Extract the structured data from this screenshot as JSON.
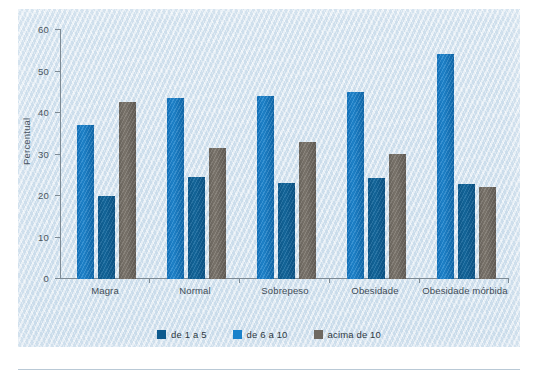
{
  "chart_data": {
    "type": "bar",
    "title": "",
    "xlabel": "",
    "ylabel": "Percentual",
    "ylim": [
      0,
      60
    ],
    "yticks": [
      0,
      10,
      20,
      30,
      40,
      50,
      60
    ],
    "ytick_labels": [
      "0",
      "10",
      "20",
      "30",
      "40",
      "50",
      "60"
    ],
    "grid": false,
    "legend_position": "bottom",
    "categories": [
      "Magra",
      "Normal",
      "Sobrepeso",
      "Obesidade",
      "Obesidade mórbida"
    ],
    "series": [
      {
        "name": "de 1 a 5",
        "color": "#0d5a8e",
        "values": [
          20.0,
          24.7,
          23.2,
          24.4,
          22.8
        ]
      },
      {
        "name": "de 6 a 10",
        "color": "#1a82cb",
        "values": [
          37.2,
          43.6,
          44.2,
          45.0,
          54.2
        ]
      },
      {
        "name": "acima de 10",
        "color": "#6f6961",
        "values": [
          42.6,
          31.5,
          32.9,
          30.1,
          22.2
        ]
      }
    ],
    "bar_draw_order": [
      "de 6 a 10",
      "de 1 a 5",
      "acima de 10"
    ]
  },
  "axis": {
    "y_label": "Percentual",
    "y_ticks": [
      "60",
      "50",
      "40",
      "30",
      "20",
      "10",
      "0"
    ]
  },
  "legend": {
    "items": [
      {
        "label": "de 1 a 5"
      },
      {
        "label": "de 6 a 10"
      },
      {
        "label": "acima de 10"
      }
    ]
  },
  "categories": [
    {
      "label": "Magra"
    },
    {
      "label": "Normal"
    },
    {
      "label": "Sobrepeso"
    },
    {
      "label": "Obesidade"
    },
    {
      "label": "Obesidade mórbida"
    }
  ],
  "colors": {
    "series_1": "#0d5a8e",
    "series_2": "#1a82cb",
    "series_3": "#6f6961",
    "panel_background": "#d9e6f1",
    "axis": "#7d8a94",
    "text": "#404b55"
  }
}
